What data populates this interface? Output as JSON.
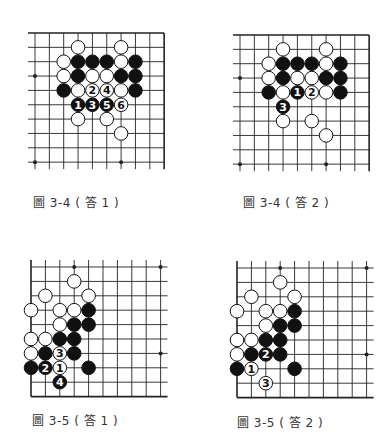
{
  "colors": {
    "line": "#222222",
    "black_stone": "#111111",
    "white_stone": "#ffffff",
    "caption": "#333333"
  },
  "diagrams": [
    {
      "id": "fig-3-4-ans-1",
      "caption": "圖 3-4 ( 答 1 )",
      "origin": [
        35,
        33
      ],
      "spacing": 14.35,
      "cols": 10,
      "rows": 10,
      "edges": {
        "top": true,
        "right": true,
        "left": false,
        "bottom": false
      },
      "star_points": [
        [
          0,
          3
        ],
        [
          0,
          9
        ],
        [
          6,
          9
        ]
      ],
      "stones": [
        {
          "c": 3,
          "r": 1,
          "color": "W"
        },
        {
          "c": 6,
          "r": 1,
          "color": "W"
        },
        {
          "c": 2,
          "r": 2,
          "color": "W"
        },
        {
          "c": 3,
          "r": 2,
          "color": "B"
        },
        {
          "c": 4,
          "r": 2,
          "color": "B"
        },
        {
          "c": 5,
          "r": 2,
          "color": "B"
        },
        {
          "c": 6,
          "r": 2,
          "color": "W"
        },
        {
          "c": 7,
          "r": 2,
          "color": "B"
        },
        {
          "c": 2,
          "r": 3,
          "color": "W"
        },
        {
          "c": 3,
          "r": 3,
          "color": "B"
        },
        {
          "c": 4,
          "r": 3,
          "color": "W"
        },
        {
          "c": 5,
          "r": 3,
          "color": "W"
        },
        {
          "c": 6,
          "r": 3,
          "color": "B"
        },
        {
          "c": 7,
          "r": 3,
          "color": "B"
        },
        {
          "c": 2,
          "r": 4,
          "color": "B"
        },
        {
          "c": 3,
          "r": 4,
          "color": "W"
        },
        {
          "c": 4,
          "r": 4,
          "color": "W",
          "label": "2"
        },
        {
          "c": 5,
          "r": 4,
          "color": "W",
          "label": "4"
        },
        {
          "c": 6,
          "r": 4,
          "color": "W"
        },
        {
          "c": 7,
          "r": 4,
          "color": "B"
        },
        {
          "c": 3,
          "r": 5,
          "color": "B",
          "label": "1"
        },
        {
          "c": 4,
          "r": 5,
          "color": "B",
          "label": "3"
        },
        {
          "c": 5,
          "r": 5,
          "color": "B",
          "label": "5"
        },
        {
          "c": 6,
          "r": 5,
          "color": "W",
          "label": "6"
        },
        {
          "c": 3,
          "r": 6,
          "color": "W"
        },
        {
          "c": 5,
          "r": 6,
          "color": "W"
        },
        {
          "c": 6,
          "r": 7,
          "color": "W"
        }
      ],
      "caption_pos": [
        33,
        204
      ]
    },
    {
      "id": "fig-3-4-ans-2",
      "caption": "圖 3-4 ( 答 2 )",
      "origin": [
        240,
        35
      ],
      "spacing": 14.35,
      "cols": 10,
      "rows": 10,
      "edges": {
        "top": true,
        "right": true,
        "left": false,
        "bottom": false
      },
      "star_points": [
        [
          0,
          3
        ],
        [
          0,
          9
        ],
        [
          6,
          9
        ]
      ],
      "stones": [
        {
          "c": 3,
          "r": 1,
          "color": "W"
        },
        {
          "c": 6,
          "r": 1,
          "color": "W"
        },
        {
          "c": 2,
          "r": 2,
          "color": "W"
        },
        {
          "c": 3,
          "r": 2,
          "color": "B"
        },
        {
          "c": 4,
          "r": 2,
          "color": "B"
        },
        {
          "c": 5,
          "r": 2,
          "color": "B"
        },
        {
          "c": 6,
          "r": 2,
          "color": "W"
        },
        {
          "c": 7,
          "r": 2,
          "color": "B"
        },
        {
          "c": 2,
          "r": 3,
          "color": "W"
        },
        {
          "c": 3,
          "r": 3,
          "color": "B"
        },
        {
          "c": 4,
          "r": 3,
          "color": "W"
        },
        {
          "c": 5,
          "r": 3,
          "color": "W"
        },
        {
          "c": 6,
          "r": 3,
          "color": "B"
        },
        {
          "c": 7,
          "r": 3,
          "color": "B"
        },
        {
          "c": 2,
          "r": 4,
          "color": "B"
        },
        {
          "c": 3,
          "r": 4,
          "color": "W"
        },
        {
          "c": 4,
          "r": 4,
          "color": "B",
          "label": "1"
        },
        {
          "c": 5,
          "r": 4,
          "color": "W",
          "label": "2"
        },
        {
          "c": 6,
          "r": 4,
          "color": "W"
        },
        {
          "c": 7,
          "r": 4,
          "color": "B"
        },
        {
          "c": 3,
          "r": 5,
          "color": "B",
          "label": "3"
        },
        {
          "c": 3,
          "r": 6,
          "color": "W"
        },
        {
          "c": 5,
          "r": 6,
          "color": "W"
        },
        {
          "c": 6,
          "r": 7,
          "color": "W"
        }
      ],
      "caption_pos": [
        243,
        204
      ]
    },
    {
      "id": "fig-3-5-ans-1",
      "caption": "圖 3-5 ( 答 1 )",
      "origin": [
        31,
        267
      ],
      "spacing": 14.4,
      "cols": 10,
      "rows": 10,
      "edges": {
        "top": false,
        "right": false,
        "left": true,
        "bottom": true
      },
      "star_points": [
        [
          3,
          0
        ],
        [
          9,
          0
        ],
        [
          9,
          6
        ]
      ],
      "stones": [
        {
          "c": 3,
          "r": 1,
          "color": "W"
        },
        {
          "c": 1,
          "r": 2,
          "color": "W"
        },
        {
          "c": 4,
          "r": 2,
          "color": "W"
        },
        {
          "c": 0,
          "r": 3,
          "color": "W"
        },
        {
          "c": 2,
          "r": 3,
          "color": "W"
        },
        {
          "c": 3,
          "r": 3,
          "color": "W"
        },
        {
          "c": 4,
          "r": 3,
          "color": "B"
        },
        {
          "c": 2,
          "r": 4,
          "color": "W"
        },
        {
          "c": 3,
          "r": 4,
          "color": "B"
        },
        {
          "c": 4,
          "r": 4,
          "color": "B"
        },
        {
          "c": 0,
          "r": 5,
          "color": "W"
        },
        {
          "c": 1,
          "r": 5,
          "color": "W"
        },
        {
          "c": 2,
          "r": 5,
          "color": "B"
        },
        {
          "c": 3,
          "r": 5,
          "color": "B"
        },
        {
          "c": 0,
          "r": 6,
          "color": "W"
        },
        {
          "c": 1,
          "r": 6,
          "color": "B"
        },
        {
          "c": 2,
          "r": 6,
          "color": "W",
          "label": "3"
        },
        {
          "c": 3,
          "r": 6,
          "color": "B"
        },
        {
          "c": 0,
          "r": 7,
          "color": "B"
        },
        {
          "c": 1,
          "r": 7,
          "color": "B",
          "label": "2"
        },
        {
          "c": 2,
          "r": 7,
          "color": "W",
          "label": "1"
        },
        {
          "c": 4,
          "r": 7,
          "color": "B"
        },
        {
          "c": 2,
          "r": 8,
          "color": "B",
          "label": "4"
        }
      ],
      "caption_pos": [
        32,
        422
      ]
    },
    {
      "id": "fig-3-5-ans-2",
      "caption": "圖 3-5 ( 答 2 )",
      "origin": [
        237,
        268
      ],
      "spacing": 14.4,
      "cols": 10,
      "rows": 10,
      "edges": {
        "top": false,
        "right": false,
        "left": true,
        "bottom": true
      },
      "star_points": [
        [
          3,
          0
        ],
        [
          9,
          0
        ],
        [
          9,
          6
        ]
      ],
      "stones": [
        {
          "c": 3,
          "r": 1,
          "color": "W"
        },
        {
          "c": 1,
          "r": 2,
          "color": "W"
        },
        {
          "c": 4,
          "r": 2,
          "color": "W"
        },
        {
          "c": 0,
          "r": 3,
          "color": "W"
        },
        {
          "c": 2,
          "r": 3,
          "color": "W"
        },
        {
          "c": 3,
          "r": 3,
          "color": "W"
        },
        {
          "c": 4,
          "r": 3,
          "color": "B"
        },
        {
          "c": 2,
          "r": 4,
          "color": "W"
        },
        {
          "c": 3,
          "r": 4,
          "color": "B"
        },
        {
          "c": 4,
          "r": 4,
          "color": "B"
        },
        {
          "c": 0,
          "r": 5,
          "color": "W"
        },
        {
          "c": 1,
          "r": 5,
          "color": "W"
        },
        {
          "c": 2,
          "r": 5,
          "color": "B"
        },
        {
          "c": 3,
          "r": 5,
          "color": "B"
        },
        {
          "c": 0,
          "r": 6,
          "color": "W"
        },
        {
          "c": 1,
          "r": 6,
          "color": "B"
        },
        {
          "c": 2,
          "r": 6,
          "color": "B",
          "label": "2"
        },
        {
          "c": 3,
          "r": 6,
          "color": "B"
        },
        {
          "c": 0,
          "r": 7,
          "color": "B"
        },
        {
          "c": 1,
          "r": 7,
          "color": "W",
          "label": "1"
        },
        {
          "c": 4,
          "r": 7,
          "color": "B"
        },
        {
          "c": 2,
          "r": 8,
          "color": "W",
          "label": "3"
        }
      ],
      "caption_pos": [
        237,
        424
      ]
    }
  ]
}
